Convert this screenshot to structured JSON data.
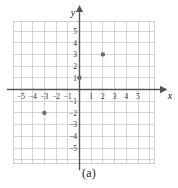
{
  "figure": {
    "caption": "(a)",
    "axis_labels": {
      "x": "x",
      "y": "y"
    },
    "colors": {
      "grid": "#c9c9c9",
      "axis": "#555555",
      "point": "#6b6b6b",
      "text": "#2b2b2b",
      "background": "#ffffff"
    }
  },
  "chart_data": {
    "type": "scatter",
    "title": "",
    "subtitle": "",
    "xlabel": "x",
    "ylabel": "y",
    "xlim": [
      -6,
      6
    ],
    "ylim": [
      -6,
      6
    ],
    "xticks": [
      -5,
      -4,
      -3,
      -2,
      -1,
      1,
      2,
      3,
      4,
      5
    ],
    "xtick_labels": [
      "−5",
      "−4",
      "−3",
      "−2",
      "−1",
      "1",
      "2",
      "3",
      "4",
      "5"
    ],
    "yticks": [
      5,
      4,
      3,
      2,
      1,
      -1,
      -2,
      -3,
      -4,
      -5
    ],
    "ytick_labels": [
      "5",
      "4",
      "3",
      "2",
      "1",
      "−1",
      "−2",
      "−3",
      "−4",
      "−5"
    ],
    "grid": true,
    "grid_step": 1,
    "legend": null,
    "legend_position": "none",
    "annotations": [
      "(a)"
    ],
    "points": [
      {
        "x": 2,
        "y": 3
      },
      {
        "x": 0,
        "y": 1
      },
      {
        "x": -3,
        "y": -2
      }
    ]
  }
}
